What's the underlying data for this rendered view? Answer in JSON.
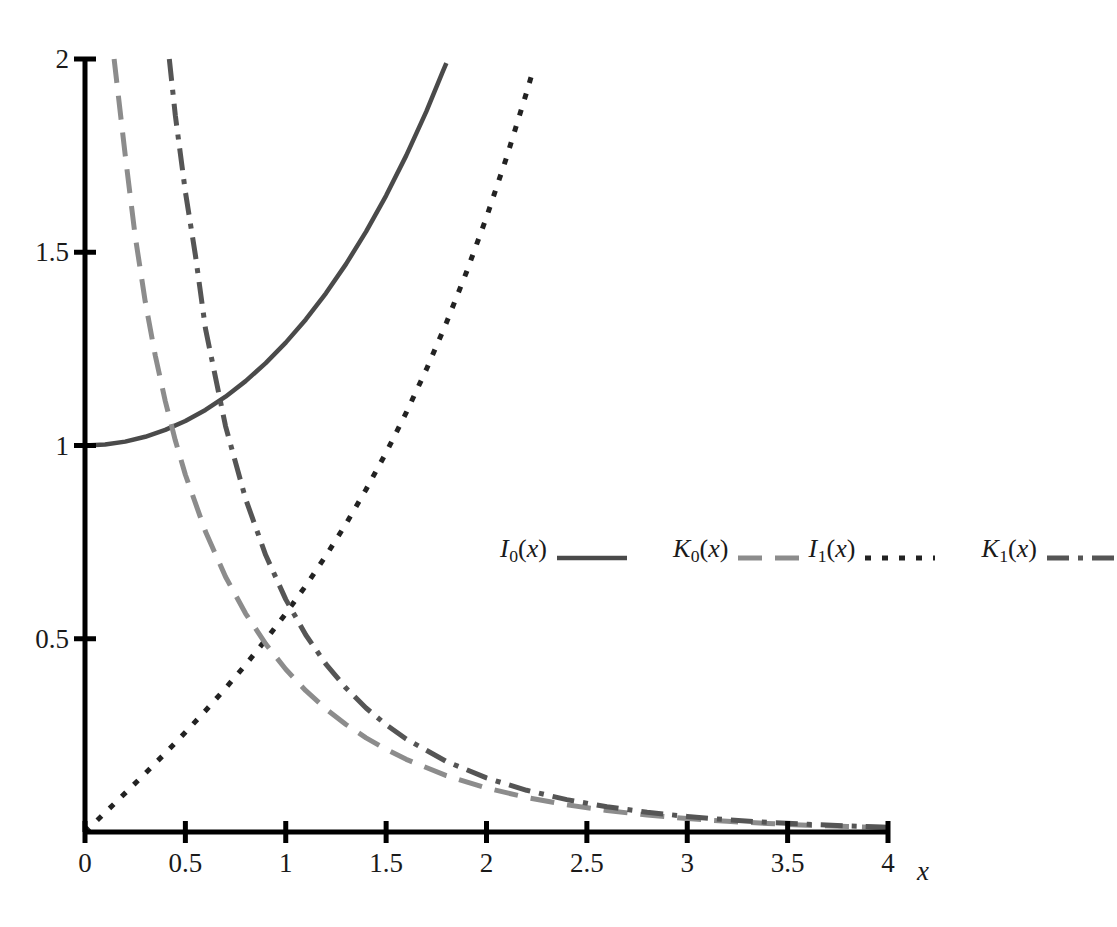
{
  "chart_data": {
    "type": "line",
    "title": "",
    "xlabel": "x",
    "ylabel": "",
    "xlim": [
      0,
      4
    ],
    "ylim": [
      0,
      2
    ],
    "grid": false,
    "legend_position": "center-right",
    "xticks": [
      0,
      0.5,
      1,
      1.5,
      2,
      2.5,
      3,
      3.5,
      4
    ],
    "xtick_labels": [
      "0",
      "0.5",
      "1",
      "1.5",
      "2",
      "2.5",
      "3",
      "3.5",
      "4"
    ],
    "yticks": [
      0.5,
      1,
      1.5,
      2
    ],
    "ytick_labels": [
      "0.5",
      "1",
      "1.5",
      "2"
    ],
    "series": [
      {
        "name": "I0(x)",
        "label_base": "I",
        "label_sub": "0",
        "label_arg": "(x)",
        "style": "solid",
        "color": "#4a4a4a",
        "width": 4.5,
        "dash": "",
        "points": [
          [
            0.0,
            1.0
          ],
          [
            0.1,
            1.0025
          ],
          [
            0.2,
            1.01
          ],
          [
            0.3,
            1.0226
          ],
          [
            0.4,
            1.0404
          ],
          [
            0.5,
            1.0635
          ],
          [
            0.6,
            1.092
          ],
          [
            0.7,
            1.1263
          ],
          [
            0.8,
            1.1665
          ],
          [
            0.9,
            1.213
          ],
          [
            1.0,
            1.2661
          ],
          [
            1.1,
            1.3262
          ],
          [
            1.2,
            1.3937
          ],
          [
            1.3,
            1.4693
          ],
          [
            1.4,
            1.5534
          ],
          [
            1.5,
            1.6467
          ],
          [
            1.6,
            1.75
          ],
          [
            1.7,
            1.864
          ],
          [
            1.78,
            1.9646
          ],
          [
            1.8,
            1.9896
          ]
        ]
      },
      {
        "name": "I1(x)",
        "label_base": "I",
        "label_sub": "1",
        "label_arg": "(x)",
        "style": "dotted",
        "color": "#222222",
        "width": 5,
        "dash": "6 11",
        "points": [
          [
            0.0,
            0.0
          ],
          [
            0.1,
            0.0501
          ],
          [
            0.2,
            0.1005
          ],
          [
            0.3,
            0.1517
          ],
          [
            0.4,
            0.204
          ],
          [
            0.5,
            0.2579
          ],
          [
            0.6,
            0.3137
          ],
          [
            0.7,
            0.3719
          ],
          [
            0.8,
            0.4329
          ],
          [
            0.9,
            0.4971
          ],
          [
            1.0,
            0.5652
          ],
          [
            1.1,
            0.6375
          ],
          [
            1.2,
            0.7147
          ],
          [
            1.3,
            0.7973
          ],
          [
            1.4,
            0.8861
          ],
          [
            1.5,
            0.9817
          ],
          [
            1.6,
            1.0848
          ],
          [
            1.7,
            1.1963
          ],
          [
            1.8,
            1.3172
          ],
          [
            1.9,
            1.4482
          ],
          [
            2.0,
            1.5906
          ],
          [
            2.1,
            1.7455
          ],
          [
            2.2,
            1.9141
          ],
          [
            2.23,
            1.9678
          ]
        ]
      },
      {
        "name": "K0(x)",
        "label_base": "K",
        "label_sub": "0",
        "label_arg": "(x)",
        "style": "long-dash",
        "color": "#8c8c8c",
        "width": 5,
        "dash": "24 13",
        "points": [
          [
            0.145,
            2.0
          ],
          [
            0.2,
            1.7527
          ],
          [
            0.25,
            1.5415
          ],
          [
            0.3,
            1.3725
          ],
          [
            0.35,
            1.2327
          ],
          [
            0.4,
            1.1145
          ],
          [
            0.45,
            1.0129
          ],
          [
            0.5,
            0.9244
          ],
          [
            0.6,
            0.7775
          ],
          [
            0.7,
            0.6605
          ],
          [
            0.8,
            0.5653
          ],
          [
            0.9,
            0.4867
          ],
          [
            1.0,
            0.421
          ],
          [
            1.1,
            0.3656
          ],
          [
            1.2,
            0.3185
          ],
          [
            1.3,
            0.2782
          ],
          [
            1.4,
            0.2437
          ],
          [
            1.5,
            0.2138
          ],
          [
            1.6,
            0.188
          ],
          [
            1.8,
            0.1459
          ],
          [
            2.0,
            0.1139
          ],
          [
            2.2,
            0.0893
          ],
          [
            2.4,
            0.0702
          ],
          [
            2.6,
            0.0554
          ],
          [
            2.8,
            0.0438
          ],
          [
            3.0,
            0.0347
          ],
          [
            3.2,
            0.0276
          ],
          [
            3.4,
            0.022
          ],
          [
            3.6,
            0.0175
          ],
          [
            3.8,
            0.014
          ],
          [
            4.0,
            0.0112
          ]
        ]
      },
      {
        "name": "K1(x)",
        "label_base": "K",
        "label_sub": "1",
        "label_arg": "(x)",
        "style": "dash-dot",
        "color": "#555555",
        "width": 5,
        "dash": "22 9 5 9",
        "points": [
          [
            0.42,
            2.0
          ],
          [
            0.45,
            1.8537
          ],
          [
            0.5,
            1.6564
          ],
          [
            0.55,
            1.4922
          ],
          [
            0.6,
            1.3028
          ],
          [
            0.7,
            1.0503
          ],
          [
            0.8,
            0.8618
          ],
          [
            0.9,
            0.7165
          ],
          [
            1.0,
            0.6019
          ],
          [
            1.1,
            0.5098
          ],
          [
            1.2,
            0.4346
          ],
          [
            1.3,
            0.3725
          ],
          [
            1.4,
            0.3208
          ],
          [
            1.5,
            0.2774
          ],
          [
            1.6,
            0.2406
          ],
          [
            1.8,
            0.1826
          ],
          [
            2.0,
            0.1399
          ],
          [
            2.2,
            0.1079
          ],
          [
            2.4,
            0.0837
          ],
          [
            2.6,
            0.0653
          ],
          [
            2.8,
            0.0511
          ],
          [
            3.0,
            0.0402
          ],
          [
            3.2,
            0.0316
          ],
          [
            3.4,
            0.025
          ],
          [
            3.6,
            0.0198
          ],
          [
            3.8,
            0.0157
          ],
          [
            4.0,
            0.0125
          ]
        ]
      }
    ]
  },
  "axes": {
    "axis_color": "#000000",
    "x_axis_label": "x",
    "tick_label_color": "#1a1a1a"
  },
  "legend": {
    "entries": [
      {
        "label_base": "I",
        "label_sub": "0",
        "label_arg": "(x)",
        "series": "I0(x)"
      },
      {
        "label_base": "K",
        "label_sub": "0",
        "label_arg": "(x)",
        "series": "K0(x)"
      },
      {
        "label_base": "I",
        "label_sub": "1",
        "label_arg": "(x)",
        "series": "I1(x)"
      },
      {
        "label_base": "K",
        "label_sub": "1",
        "label_arg": "(x)",
        "series": "K1(x)"
      }
    ]
  }
}
